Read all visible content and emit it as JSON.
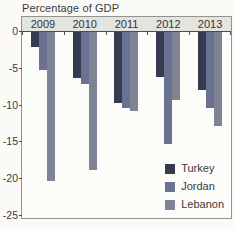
{
  "title": "Percentage of GDP",
  "chart_data": {
    "type": "bar",
    "title": "Percentage of GDP",
    "categories": [
      "2009",
      "2010",
      "2011",
      "2012",
      "2013"
    ],
    "series": [
      {
        "name": "Turkey",
        "color": "#373b51",
        "values": [
          -2.0,
          -6.3,
          -9.6,
          -6.1,
          -7.9
        ]
      },
      {
        "name": "Jordan",
        "color": "#6b7190",
        "values": [
          -5.2,
          -7.1,
          -10.3,
          -15.2,
          -10.3
        ]
      },
      {
        "name": "Lebanon",
        "color": "#7f8396",
        "values": [
          -20.3,
          -18.8,
          -10.7,
          -9.2,
          -12.7
        ]
      }
    ],
    "ylabel": "Percentage of GDP",
    "ylim": [
      -25,
      0
    ],
    "yticks": [
      0,
      -5,
      -10,
      -15,
      -20,
      -25
    ],
    "ytick_labels": [
      "0",
      "-5",
      "-10",
      "-15",
      "-20",
      "-25"
    ],
    "legend_position": "bottom-right",
    "grid": false,
    "bar_direction": "down-from-zero"
  },
  "colors": {
    "paper_background": "#fbfaf7",
    "plot_background": "#fcfcf9",
    "header_band": "#e3e3df",
    "axis_line": "#4c4c4c",
    "box_border": "#94948f",
    "text": "#3a3a3a"
  }
}
